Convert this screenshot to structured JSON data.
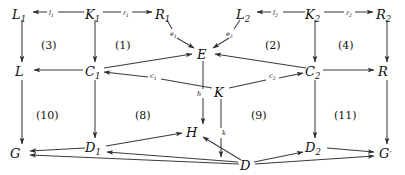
{
  "diagram": {
    "background_color": "#ffffff",
    "line_color": "#3b3b3b",
    "text_color": "#111111",
    "nodes": [
      {
        "id": "L1",
        "label": "L",
        "sub": "1",
        "x": 20,
        "y": 14
      },
      {
        "id": "K1",
        "label": "K",
        "sub": "1",
        "x": 93,
        "y": 14
      },
      {
        "id": "R1",
        "label": "R",
        "sub": "1",
        "x": 163,
        "y": 14
      },
      {
        "id": "L2",
        "label": "L",
        "sub": "2",
        "x": 243,
        "y": 14
      },
      {
        "id": "K2",
        "label": "K",
        "sub": "2",
        "x": 313,
        "y": 14
      },
      {
        "id": "R2",
        "label": "R",
        "sub": "2",
        "x": 384,
        "y": 14
      },
      {
        "id": "E",
        "label": "E",
        "sub": "",
        "x": 203,
        "y": 55
      },
      {
        "id": "L",
        "label": "L",
        "sub": "",
        "x": 20,
        "y": 73
      },
      {
        "id": "C1",
        "label": "C",
        "sub": "1",
        "x": 90,
        "y": 73
      },
      {
        "id": "C2",
        "label": "C",
        "sub": "2",
        "x": 313,
        "y": 73
      },
      {
        "id": "R",
        "label": "R",
        "sub": "",
        "x": 385,
        "y": 73
      },
      {
        "id": "K",
        "label": "K",
        "sub": "",
        "x": 220,
        "y": 93
      },
      {
        "id": "G",
        "label": "G",
        "sub": "",
        "x": 16,
        "y": 155
      },
      {
        "id": "D1",
        "label": "D",
        "sub": "1",
        "x": 90,
        "y": 149
      },
      {
        "id": "H",
        "label": "H",
        "sub": "",
        "x": 192,
        "y": 133
      },
      {
        "id": "D",
        "label": "D",
        "sub": "",
        "x": 246,
        "y": 166
      },
      {
        "id": "D2",
        "label": "D",
        "sub": "2",
        "x": 313,
        "y": 149
      },
      {
        "id": "Gp",
        "label": "G",
        "sub": "",
        "prime": "′",
        "x": 386,
        "y": 155
      }
    ],
    "edge_labels": [
      {
        "id": "l1",
        "label": "l",
        "sub": "1",
        "x": 50,
        "y": 17
      },
      {
        "id": "r1",
        "label": "r",
        "sub": "1",
        "x": 125,
        "y": 17
      },
      {
        "id": "l2",
        "label": "l",
        "sub": "2",
        "x": 275,
        "y": 17
      },
      {
        "id": "r2",
        "label": "r",
        "sub": "2",
        "x": 348,
        "y": 17
      },
      {
        "id": "e1",
        "label": "e",
        "sub": "1",
        "x": 172,
        "y": 34
      },
      {
        "id": "e2",
        "label": "e",
        "sub": "2",
        "x": 228,
        "y": 34
      },
      {
        "id": "c1",
        "label": "c",
        "sub": "1",
        "x": 152,
        "y": 76
      },
      {
        "id": "c2",
        "label": "c",
        "sub": "2",
        "x": 272,
        "y": 76
      },
      {
        "id": "h",
        "label": "h",
        "sub": "",
        "x": 199,
        "y": 94
      },
      {
        "id": "k",
        "label": "k",
        "sub": "",
        "x": 224,
        "y": 133
      }
    ],
    "region_labels": [
      {
        "id": "region-3",
        "label": "(3)",
        "x": 52,
        "y": 45
      },
      {
        "id": "region-1",
        "label": "(1)",
        "x": 126,
        "y": 45
      },
      {
        "id": "region-2",
        "label": "(2)",
        "x": 276,
        "y": 45
      },
      {
        "id": "region-4",
        "label": "(4)",
        "x": 349,
        "y": 45
      },
      {
        "id": "region-10",
        "label": "(10)",
        "x": 50,
        "y": 115
      },
      {
        "id": "region-8",
        "label": "(8)",
        "x": 146,
        "y": 115
      },
      {
        "id": "region-9",
        "label": "(9)",
        "x": 262,
        "y": 115
      },
      {
        "id": "region-11",
        "label": "(11)",
        "x": 348,
        "y": 115
      }
    ],
    "edges": [
      {
        "id": "K1-L1",
        "from": "K1",
        "to": "L1",
        "label": "l1",
        "kind": "horizontal-gap"
      },
      {
        "id": "K1-R1",
        "from": "K1",
        "to": "R1",
        "label": "r1",
        "kind": "horizontal-gap"
      },
      {
        "id": "K2-L2",
        "from": "K2",
        "to": "L2",
        "label": "l2",
        "kind": "horizontal-gap"
      },
      {
        "id": "K2-R2",
        "from": "K2",
        "to": "R2",
        "label": "r2",
        "kind": "horizontal-gap"
      },
      {
        "id": "L1-L",
        "from": "L1",
        "to": "L",
        "label": "",
        "kind": "vertical"
      },
      {
        "id": "K1-C1",
        "from": "K1",
        "to": "C1",
        "label": "",
        "kind": "vertical"
      },
      {
        "id": "R1-E",
        "from": "R1",
        "to": "E",
        "label": "e1",
        "kind": "diagonal"
      },
      {
        "id": "L2-E",
        "from": "L2",
        "to": "E",
        "label": "e2",
        "kind": "diagonal"
      },
      {
        "id": "K2-C2",
        "from": "K2",
        "to": "C2",
        "label": "",
        "kind": "vertical"
      },
      {
        "id": "R2-R",
        "from": "R2",
        "to": "R",
        "label": "",
        "kind": "vertical"
      },
      {
        "id": "C1-L",
        "from": "C1",
        "to": "L",
        "label": "",
        "kind": "horizontal"
      },
      {
        "id": "C1-E",
        "from": "C1",
        "to": "E",
        "label": "",
        "kind": "diagonal"
      },
      {
        "id": "C2-E",
        "from": "C2",
        "to": "E",
        "label": "",
        "kind": "diagonal"
      },
      {
        "id": "C2-R",
        "from": "C2",
        "to": "R",
        "label": "",
        "kind": "horizontal"
      },
      {
        "id": "K-C1",
        "from": "K",
        "to": "C1",
        "label": "c1",
        "kind": "diagonal"
      },
      {
        "id": "K-C2",
        "from": "K",
        "to": "C2",
        "label": "c2",
        "kind": "diagonal"
      },
      {
        "id": "E-H",
        "from": "E",
        "to": "H",
        "label": "h",
        "kind": "vertical"
      },
      {
        "id": "K-D",
        "from": "K",
        "to": "D",
        "label": "k",
        "kind": "vertical"
      },
      {
        "id": "L-G",
        "from": "L",
        "to": "G",
        "label": "",
        "kind": "vertical"
      },
      {
        "id": "C1-D1",
        "from": "C1",
        "to": "D1",
        "label": "",
        "kind": "vertical"
      },
      {
        "id": "C2-D2",
        "from": "C2",
        "to": "D2",
        "label": "",
        "kind": "vertical"
      },
      {
        "id": "R-Gp",
        "from": "R",
        "to": "Gp",
        "label": "",
        "kind": "vertical"
      },
      {
        "id": "D1-G",
        "from": "D1",
        "to": "G",
        "label": "",
        "kind": "horizontal"
      },
      {
        "id": "D1-H",
        "from": "D1",
        "to": "H",
        "label": "",
        "kind": "diagonal"
      },
      {
        "id": "D2-Gp",
        "from": "D2",
        "to": "Gp",
        "label": "",
        "kind": "diagonal"
      },
      {
        "id": "D-D1",
        "from": "D",
        "to": "D1",
        "label": "",
        "kind": "diagonal"
      },
      {
        "id": "D-D2",
        "from": "D",
        "to": "D2",
        "label": "",
        "kind": "diagonal"
      },
      {
        "id": "D-H",
        "from": "D",
        "to": "H",
        "label": "",
        "kind": "diagonal"
      },
      {
        "id": "D-G",
        "from": "D",
        "to": "G",
        "label": "",
        "kind": "diagonal"
      },
      {
        "id": "D-Gp",
        "from": "D",
        "to": "Gp",
        "label": "",
        "kind": "diagonal"
      }
    ]
  }
}
